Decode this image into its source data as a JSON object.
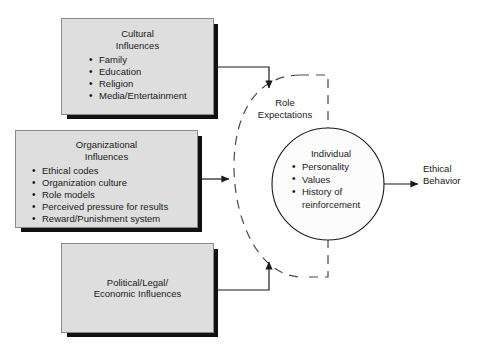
{
  "diagram": {
    "background_color": "#ffffff",
    "box_fill_color": "#dedede",
    "box_border_color": "#8a8a8a",
    "shadow_color": "#111111",
    "line_color": "#1a1a1a"
  },
  "boxes": {
    "cultural": {
      "title": "Cultural\nInfluences",
      "items": [
        "Family",
        "Education",
        "Religion",
        "Media/Entertainment"
      ]
    },
    "organizational": {
      "title": "Organizational\nInfluences",
      "items": [
        "Ethical codes",
        "Organization culture",
        "Role models",
        "Perceived pressure for results",
        "Reward/Punishment system"
      ]
    },
    "political": {
      "title": "Political/Legal/\nEconomic Influences"
    }
  },
  "center": {
    "boundary_label": "Role\nExpectations",
    "circle_title": "Individual",
    "circle_items": [
      "Personality",
      "Values",
      "History of\nreinforcement"
    ]
  },
  "output": {
    "label": "Ethical\nBehavior"
  },
  "connectors": [
    {
      "name": "cultural-to-role-expectations",
      "from": "cultural",
      "to": "role-expectations",
      "arrow": "down"
    },
    {
      "name": "organizational-to-role-expectations",
      "from": "organizational",
      "to": "role-expectations",
      "arrow": "right"
    },
    {
      "name": "political-to-role-expectations",
      "from": "political",
      "to": "role-expectations",
      "arrow": "up"
    },
    {
      "name": "individual-to-ethical-behavior",
      "from": "individual",
      "to": "ethical-behavior",
      "arrow": "right"
    }
  ]
}
